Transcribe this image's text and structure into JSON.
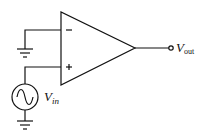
{
  "diagram": {
    "type": "op-amp circuit",
    "component": "operational amplifier",
    "inputs": {
      "inverting": {
        "sign": "−",
        "connection": "ground"
      },
      "non_inverting": {
        "sign": "+",
        "connection": "AC source V_in to ground"
      }
    },
    "labels": {
      "vin_main": "V",
      "vin_sub": "in",
      "vout_main": "V",
      "vout_sub": "out"
    },
    "icons": {
      "source": "ac-source-icon",
      "ground": "ground-icon",
      "terminal": "output-terminal-icon"
    },
    "colors": {
      "stroke": "#111111",
      "background": "#ffffff"
    }
  }
}
